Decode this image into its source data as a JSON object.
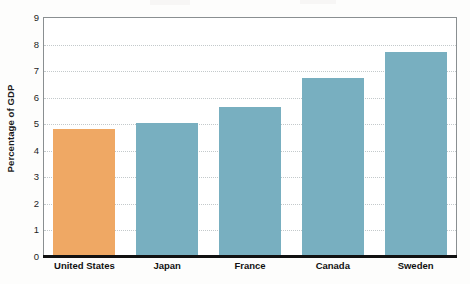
{
  "chart_data": {
    "type": "bar",
    "title": "",
    "subtitle": "",
    "xlabel": "",
    "ylabel": "Percentage of GDP",
    "categories": [
      "United States",
      "Japan",
      "France",
      "Canada",
      "Sweden"
    ],
    "values": [
      4.8,
      5.0,
      5.6,
      6.7,
      7.7
    ],
    "series": [
      {
        "name": "Percentage of GDP",
        "values": [
          4.8,
          5.0,
          5.6,
          6.7,
          7.7
        ]
      }
    ],
    "bar_colors": [
      "#efa864",
      "#78afc0",
      "#78afc0",
      "#78afc0",
      "#78afc0"
    ],
    "highlight_category": "United States",
    "highlight_color": "#efa864",
    "default_bar_color": "#78afc0",
    "ylim": [
      0,
      9
    ],
    "yticks": [
      0,
      1,
      2,
      3,
      4,
      5,
      6,
      7,
      8,
      9
    ],
    "ytick_labels": [
      "0",
      "1",
      "2",
      "3",
      "4",
      "5",
      "6",
      "7",
      "8",
      "9"
    ],
    "grid": true,
    "grid_axis": "y",
    "grid_style": "dotted",
    "grid_color": "#c3c9cb",
    "legend": false,
    "legend_position": "none",
    "axis_color": "#8a8f91",
    "baseline_color": "#111111",
    "background_color": "#ffffff"
  }
}
